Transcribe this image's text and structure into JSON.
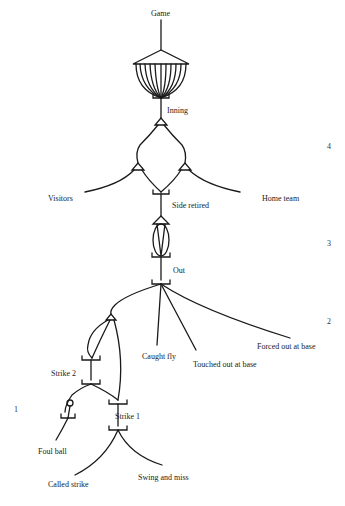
{
  "diagram": {
    "ink_color": "#1a1a1a",
    "nodes": {
      "game": "Game",
      "inning": "Inning",
      "visitors": "Visitors",
      "home_team": "Home team",
      "side_retired": "Side retired",
      "out": "Out",
      "caught_fly": "Caught fly",
      "touched_out": "Touched out at base",
      "forced_out": "Forced out at base",
      "strike2": "Strike 2",
      "strike1": "Strike 1",
      "foul_ball": "Foul ball",
      "called_strike": "Called strike",
      "swing_miss": "Swing and miss"
    },
    "levels": [
      "4",
      "3",
      "2",
      "1"
    ]
  }
}
